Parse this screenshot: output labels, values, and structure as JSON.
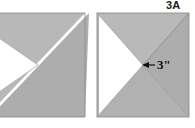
{
  "figure": {
    "label": "3A",
    "dimension_label": "3\"",
    "colors": {
      "fill_gray": "#b3b3b3",
      "fill_gray_light": "#bdbdbd",
      "fill_gray_dark": "#a8a8a8",
      "gap_white": "#ffffff",
      "outline": "#9a9a9a",
      "text": "#111111",
      "background": "#ffffff"
    },
    "shapes": [
      {
        "name": "left-square",
        "cropped_at_left_edge": true,
        "type": "square-divided-by-diagonals",
        "parts": [
          {
            "name": "upper-left-gray-triangle"
          },
          {
            "name": "lower-right-gray-triangle"
          },
          {
            "name": "white-diagonal-gap"
          },
          {
            "name": "white-wedge-pointing-right"
          }
        ]
      },
      {
        "name": "right-square",
        "cropped_at_left_edge": false,
        "type": "square-divided-by-diagonals",
        "parts": [
          {
            "name": "upper-gray-triangle"
          },
          {
            "name": "lower-gray-triangle"
          },
          {
            "name": "right-gray-triangle"
          },
          {
            "name": "white-wedge-pointing-right"
          }
        ],
        "annotation": {
          "name": "dimension-callout",
          "value": "3\"",
          "arrow_direction": "left",
          "points_to": "wedge-apex"
        }
      }
    ]
  }
}
